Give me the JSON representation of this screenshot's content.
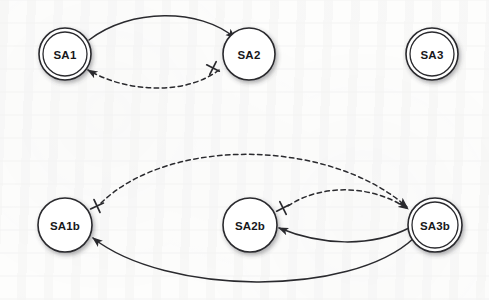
{
  "figure": {
    "background_color": "#fdfdfc",
    "ink_color": "#2a2a2e",
    "node_fill": "#ffffff"
  },
  "nodes": [
    {
      "id": "SA1",
      "label": "SA1",
      "cx": 65,
      "cy": 54,
      "r": 26,
      "double": true,
      "row": "top"
    },
    {
      "id": "SA2",
      "label": "SA2",
      "cx": 249,
      "cy": 54,
      "r": 26,
      "double": false,
      "row": "top"
    },
    {
      "id": "SA3",
      "label": "SA3",
      "cx": 432,
      "cy": 54,
      "r": 26,
      "double": true,
      "row": "top"
    },
    {
      "id": "SA1b",
      "label": "SA1b",
      "cx": 65,
      "cy": 225,
      "r": 27,
      "double": false,
      "row": "bottom"
    },
    {
      "id": "SA2b",
      "label": "SA2b",
      "cx": 250,
      "cy": 225,
      "r": 27,
      "double": false,
      "row": "bottom"
    },
    {
      "id": "SA3b",
      "label": "SA3b",
      "cx": 435,
      "cy": 225,
      "r": 27,
      "double": true,
      "row": "bottom"
    }
  ],
  "edges": [
    {
      "id": "e1",
      "from": "SA1",
      "to": "SA2",
      "style": "solid",
      "arrowhead": true,
      "cross_at_source": false,
      "path": "M 89 40 C 130 8, 200 8, 235 38"
    },
    {
      "id": "e2",
      "from": "SA2",
      "to": "SA1",
      "style": "dashed",
      "arrowhead": true,
      "cross_at_source": true,
      "cross": {
        "x": 213,
        "y": 68
      },
      "path": "M 219 70 C 185 96, 125 92, 88 70"
    },
    {
      "id": "e3",
      "from": "SA1b",
      "to": "SA3b",
      "style": "dashed",
      "arrowhead": true,
      "cross_at_source": true,
      "cross": {
        "x": 97,
        "y": 206
      },
      "path": "M 101 203 C 170 136, 330 139, 407 207"
    },
    {
      "id": "e4",
      "from": "SA2b",
      "to": "SA3b",
      "style": "dashed",
      "arrowhead": true,
      "cross_at_source": true,
      "cross": {
        "x": 283,
        "y": 208
      },
      "path": "M 288 206 C 320 184, 372 184, 408 209"
    },
    {
      "id": "e5",
      "from": "SA3b",
      "to": "SA2b",
      "style": "solid",
      "arrowhead": true,
      "cross_at_source": false,
      "path": "M 409 228 C 370 248, 320 245, 279 228"
    },
    {
      "id": "e6",
      "from": "SA3b",
      "to": "SA1b",
      "style": "solid",
      "arrowhead": true,
      "cross_at_source": false,
      "path": "M 414 238 C 350 298, 165 295, 93 238"
    }
  ],
  "legend": {
    "solid_meaning": "solid directed transition",
    "dashed_meaning": "dashed directed transition marked with cross",
    "double_circle_meaning": "double circle accepting state",
    "cross_symbol": "cross-marker"
  }
}
